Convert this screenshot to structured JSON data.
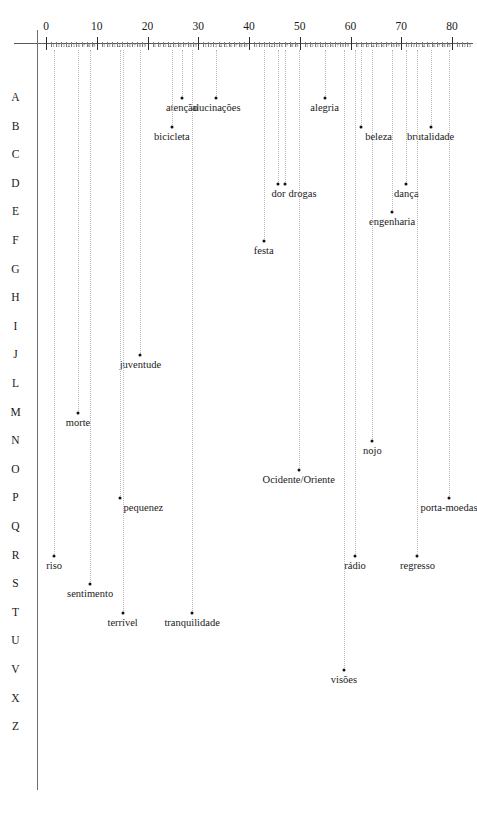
{
  "chart_data": {
    "type": "scatter",
    "title": "",
    "subtitle": "",
    "xlabel": "",
    "ylabel": "",
    "xlim": [
      -2,
      84
    ],
    "ylim_categories": [
      "A",
      "B",
      "C",
      "D",
      "E",
      "F",
      "G",
      "H",
      "I",
      "J",
      "L",
      "M",
      "N",
      "O",
      "P",
      "Q",
      "R",
      "S",
      "T",
      "U",
      "V",
      "X",
      "Z"
    ],
    "grid": "vertical-dotted-guides",
    "legend": "none",
    "axis": {
      "major_tick_values": [
        0,
        10,
        20,
        30,
        40,
        50,
        60,
        70,
        80
      ],
      "major_tick_labels": [
        "0",
        "10",
        "20",
        "30",
        "40",
        "50",
        "60",
        "70",
        "80"
      ],
      "minor_tick_digits": [
        "1",
        "2",
        "3",
        "4",
        "5",
        "6",
        "7",
        "8",
        "9"
      ],
      "orientation": "top-horizontal-ruler"
    },
    "row_labels": [
      "A",
      "B",
      "C",
      "D",
      "E",
      "F",
      "G",
      "H",
      "I",
      "J",
      "L",
      "M",
      "N",
      "O",
      "P",
      "Q",
      "R",
      "S",
      "T",
      "U",
      "V",
      "X",
      "Z"
    ],
    "points": [
      {
        "label": "atenção",
        "row": "A",
        "x": 26.8,
        "align": "center"
      },
      {
        "label": "alucinações",
        "row": "A",
        "x": 33.5,
        "align": "center"
      },
      {
        "label": "alegria",
        "row": "A",
        "x": 54.9,
        "align": "center"
      },
      {
        "label": "bicicleta",
        "row": "B",
        "x": 24.8,
        "align": "center"
      },
      {
        "label": "beleza",
        "row": "B",
        "x": 62.1,
        "align": "left"
      },
      {
        "label": "brutalidade",
        "row": "B",
        "x": 75.8,
        "align": "center"
      },
      {
        "label": "dor",
        "row": "D",
        "x": 45.8,
        "align": "center"
      },
      {
        "label": "drogas",
        "row": "D",
        "x": 47.0,
        "align": "left"
      },
      {
        "label": "dança",
        "row": "D",
        "x": 71.0,
        "align": "center"
      },
      {
        "label": "engenharia",
        "row": "E",
        "x": 68.2,
        "align": "center"
      },
      {
        "label": "festa",
        "row": "F",
        "x": 42.9,
        "align": "center"
      },
      {
        "label": "juventude",
        "row": "J",
        "x": 18.6,
        "align": "center"
      },
      {
        "label": "morte",
        "row": "M",
        "x": 6.3,
        "align": "center"
      },
      {
        "label": "nojo",
        "row": "N",
        "x": 64.3,
        "align": "center"
      },
      {
        "label": "Ocidente/Oriente",
        "row": "O",
        "x": 49.8,
        "align": "center"
      },
      {
        "label": "pequenez",
        "row": "P",
        "x": 14.5,
        "align": "left"
      },
      {
        "label": "porta-moedas",
        "row": "P",
        "x": 79.4,
        "align": "center"
      },
      {
        "label": "riso",
        "row": "R",
        "x": 1.6,
        "align": "center"
      },
      {
        "label": "rádio",
        "row": "R",
        "x": 60.9,
        "align": "center"
      },
      {
        "label": "regresso",
        "row": "R",
        "x": 73.2,
        "align": "center"
      },
      {
        "label": "sentimento",
        "row": "S",
        "x": 8.7,
        "align": "center"
      },
      {
        "label": "terrível",
        "row": "T",
        "x": 15.1,
        "align": "center"
      },
      {
        "label": "tranquilidade",
        "row": "T",
        "x": 28.8,
        "align": "center"
      },
      {
        "label": "visões",
        "row": "V",
        "x": 58.7,
        "align": "center"
      }
    ]
  },
  "colors": {
    "background": "#ffffff",
    "text": "#1a1a1a",
    "axis": "#5a5a5a",
    "guide": "#b9b9b9",
    "point": "#111111"
  }
}
